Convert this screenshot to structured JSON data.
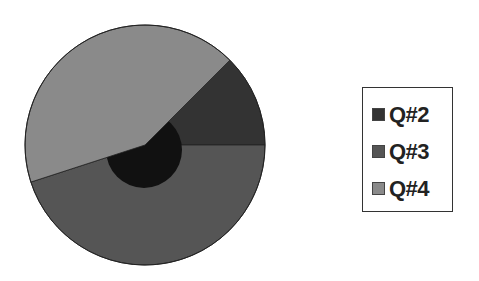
{
  "chart_data": {
    "type": "pie",
    "title": "",
    "categories": [
      "Q#2",
      "Q#3",
      "Q#4"
    ],
    "values": [
      12.5,
      45,
      42.5
    ],
    "colors": [
      "#333333",
      "#555555",
      "#8a8a8a"
    ],
    "start_angle_deg": -45,
    "inner_disc_color": "#111111",
    "legend_position": "right"
  },
  "legend": {
    "items": [
      {
        "label": "Q#2",
        "color": "#333333"
      },
      {
        "label": "Q#3",
        "color": "#555555"
      },
      {
        "label": "Q#4",
        "color": "#8a8a8a"
      }
    ]
  }
}
